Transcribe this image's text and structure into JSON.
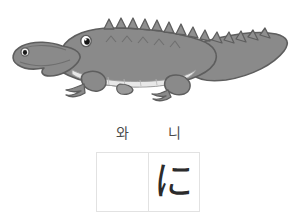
{
  "card": {
    "background_color": "#ffffff",
    "illustration": {
      "subject": "crocodile",
      "alt_label": "crocodile illustration",
      "body_color": "#8a8a8a",
      "body_shade_color": "#787878",
      "belly_color": "#e8e8e8",
      "outline_color": "#5e5e5e",
      "eye_color": "#1a1a1a",
      "spike_color": "#8f8f8f"
    },
    "reading": {
      "label": "reading-row",
      "syllables": [
        {
          "text": "와"
        },
        {
          "text": "니"
        }
      ]
    },
    "answer": {
      "label": "answer-grid",
      "border_color": "#e2e2e2",
      "cells": [
        {
          "text": "",
          "filled": false
        },
        {
          "text": "に",
          "filled": true
        }
      ]
    }
  }
}
